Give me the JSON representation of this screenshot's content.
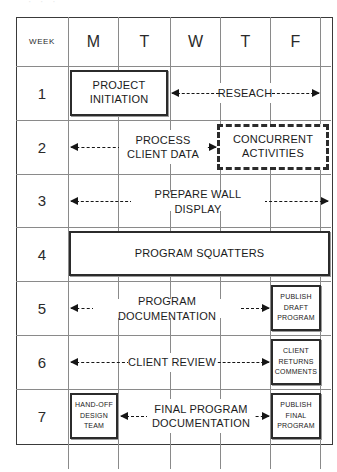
{
  "artifact_text": "· · ·",
  "table": {
    "week_header": "WEEK",
    "day_headers": [
      "M",
      "T",
      "W",
      "T",
      "F"
    ],
    "week_numbers": [
      "1",
      "2",
      "3",
      "4",
      "5",
      "6",
      "7"
    ]
  },
  "rows": [
    {
      "week": "1",
      "items": [
        {
          "kind": "box-solid",
          "text": "PROJECT\nINITIATION"
        },
        {
          "kind": "arrow-left"
        },
        {
          "kind": "label",
          "text": "RESEACH"
        },
        {
          "kind": "arrow-right"
        }
      ]
    },
    {
      "week": "2",
      "items": [
        {
          "kind": "arrow-left"
        },
        {
          "kind": "label",
          "text": "PROCESS\nCLIENT DATA"
        },
        {
          "kind": "arrow-right"
        },
        {
          "kind": "box-dashed",
          "text": "CONCURRENT\nACTIVITIES"
        }
      ]
    },
    {
      "week": "3",
      "items": [
        {
          "kind": "arrow-left"
        },
        {
          "kind": "label",
          "text": "PREPARE WALL DISPLAY"
        },
        {
          "kind": "arrow-right"
        }
      ]
    },
    {
      "week": "4",
      "items": [
        {
          "kind": "box-solid",
          "text": "PROGRAM SQUATTERS"
        }
      ]
    },
    {
      "week": "5",
      "items": [
        {
          "kind": "arrow-left"
        },
        {
          "kind": "label",
          "text": "PROGRAM DOCUMENTATION"
        },
        {
          "kind": "arrow-right"
        },
        {
          "kind": "box-solid-sm",
          "text": "PUBLISH\nDRAFT\nPROGRAM"
        }
      ]
    },
    {
      "week": "6",
      "items": [
        {
          "kind": "arrow-left"
        },
        {
          "kind": "label",
          "text": "CLIENT REVIEW"
        },
        {
          "kind": "arrow-right"
        },
        {
          "kind": "box-solid-sm",
          "text": "CLIENT\nRETURNS\nCOMMENTS"
        }
      ]
    },
    {
      "week": "7",
      "items": [
        {
          "kind": "box-solid-sm",
          "text": "HAND-OFF\nDESIGN\nTEAM"
        },
        {
          "kind": "arrow-left"
        },
        {
          "kind": "label",
          "text": "FINAL PROGRAM\nDOCUMENTATION"
        },
        {
          "kind": "arrow-right"
        },
        {
          "kind": "box-solid-sm",
          "text": "PUBLISH\nFINAL\nPROGRAM"
        }
      ]
    }
  ],
  "boxes": {
    "project_initiation": "PROJECT\nINITIATION",
    "concurrent_activities": "CONCURRENT\nACTIVITIES",
    "program_squatters": "PROGRAM SQUATTERS",
    "publish_draft_program_1": "PUBLISH",
    "publish_draft_program_2": "DRAFT",
    "publish_draft_program_3": "PROGRAM",
    "client_returns_comments_1": "CLIENT",
    "client_returns_comments_2": "RETURNS",
    "client_returns_comments_3": "COMMENTS",
    "hand_off_design_team_1": "HAND-OFF",
    "hand_off_design_team_2": "DESIGN",
    "hand_off_design_team_3": "TEAM",
    "publish_final_program_1": "PUBLISH",
    "publish_final_program_2": "FINAL",
    "publish_final_program_3": "PROGRAM"
  },
  "labels": {
    "reseach": "RESEACH",
    "process_client_data": "PROCESS\nCLIENT DATA",
    "prepare_wall_display": "PREPARE WALL DISPLAY",
    "program_documentation": "PROGRAM DOCUMENTATION",
    "client_review": "CLIENT REVIEW",
    "final_program_documentation": "FINAL PROGRAM\nDOCUMENTATION"
  },
  "colors": {
    "grid": "#8a8a8a",
    "frame": "#3a3a3a",
    "ink": "#161616",
    "background": "#ffffff"
  }
}
